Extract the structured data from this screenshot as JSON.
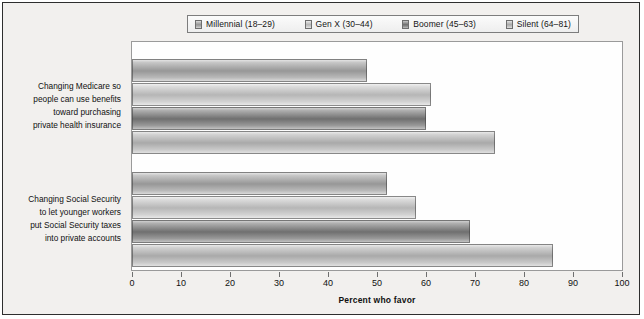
{
  "legend": {
    "items": [
      {
        "label": "Millennial (18–29)"
      },
      {
        "label": "Gen X (30–44)"
      },
      {
        "label": "Boomer (45–63)"
      },
      {
        "label": "Silent (64–81)"
      }
    ]
  },
  "axis": {
    "x_title": "Percent who favor"
  },
  "chart_data": {
    "type": "bar",
    "orientation": "horizontal",
    "title": "",
    "xlabel": "Percent who favor",
    "ylabel": "",
    "xlim": [
      0,
      100
    ],
    "xticks": [
      0,
      10,
      20,
      30,
      40,
      50,
      60,
      70,
      80,
      90,
      100
    ],
    "grid": false,
    "legend_position": "top",
    "categories": [
      "Changing Medicare so people can use benefits toward purchasing private health insurance",
      "Changing Social Security to let younger workers put Social Security taxes into private accounts"
    ],
    "category_label_lines": [
      [
        "Changing Medicare so",
        "people can use benefits",
        "toward purchasing",
        "private health insurance"
      ],
      [
        "Changing Social Security",
        "to let younger workers",
        "put Social Security taxes",
        "into private accounts"
      ]
    ],
    "series": [
      {
        "name": "Millennial (18–29)",
        "values": [
          48,
          52
        ]
      },
      {
        "name": "Gen X (30–44)",
        "values": [
          61,
          58
        ]
      },
      {
        "name": "Boomer (45–63)",
        "values": [
          60,
          69
        ]
      },
      {
        "name": "Silent (64–81)",
        "values": [
          74,
          86
        ]
      }
    ]
  }
}
